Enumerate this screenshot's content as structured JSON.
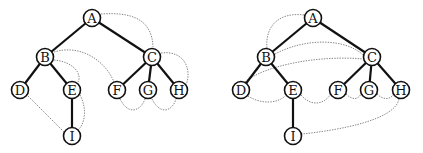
{
  "diagrams": [
    {
      "name": "left-tree",
      "nodes": [
        {
          "id": "A",
          "label": "A",
          "x": 92,
          "y": 18
        },
        {
          "id": "B",
          "label": "B",
          "x": 45,
          "y": 57
        },
        {
          "id": "C",
          "label": "C",
          "x": 152,
          "y": 57
        },
        {
          "id": "D",
          "label": "D",
          "x": 20,
          "y": 90
        },
        {
          "id": "E",
          "label": "E",
          "x": 72,
          "y": 90
        },
        {
          "id": "F",
          "label": "F",
          "x": 117,
          "y": 90
        },
        {
          "id": "G",
          "label": "G",
          "x": 148,
          "y": 90
        },
        {
          "id": "H",
          "label": "H",
          "x": 179,
          "y": 90
        },
        {
          "id": "I",
          "label": "I",
          "x": 72,
          "y": 136
        }
      ],
      "edges": [
        [
          "A",
          "B"
        ],
        [
          "A",
          "C"
        ],
        [
          "B",
          "D"
        ],
        [
          "B",
          "E"
        ],
        [
          "C",
          "F"
        ],
        [
          "C",
          "G"
        ],
        [
          "C",
          "H"
        ],
        [
          "E",
          "I"
        ]
      ],
      "threads": [
        [
          "A",
          "C"
        ],
        [
          "B",
          "F"
        ],
        [
          "B",
          "E"
        ],
        [
          "E",
          "I"
        ],
        [
          "D",
          "I"
        ],
        [
          "C",
          "H"
        ],
        [
          "F",
          "G"
        ],
        [
          "G",
          "H"
        ]
      ]
    },
    {
      "name": "right-tree",
      "nodes": [
        {
          "id": "A",
          "label": "A",
          "x": 313,
          "y": 18
        },
        {
          "id": "B",
          "label": "B",
          "x": 266,
          "y": 57
        },
        {
          "id": "C",
          "label": "C",
          "x": 372,
          "y": 57
        },
        {
          "id": "D",
          "label": "D",
          "x": 241,
          "y": 90
        },
        {
          "id": "E",
          "label": "E",
          "x": 293,
          "y": 90
        },
        {
          "id": "F",
          "label": "F",
          "x": 338,
          "y": 90
        },
        {
          "id": "G",
          "label": "G",
          "x": 369,
          "y": 90
        },
        {
          "id": "H",
          "label": "H",
          "x": 401,
          "y": 90
        },
        {
          "id": "I",
          "label": "I",
          "x": 293,
          "y": 136
        }
      ],
      "edges": [
        [
          "A",
          "B"
        ],
        [
          "A",
          "C"
        ],
        [
          "B",
          "D"
        ],
        [
          "B",
          "E"
        ],
        [
          "C",
          "F"
        ],
        [
          "C",
          "G"
        ],
        [
          "C",
          "H"
        ],
        [
          "E",
          "I"
        ]
      ],
      "threads": [
        [
          "A",
          "B"
        ],
        [
          "B",
          "C"
        ],
        [
          "D",
          "C"
        ],
        [
          "D",
          "E"
        ],
        [
          "E",
          "F"
        ],
        [
          "F",
          "G"
        ],
        [
          "G",
          "H"
        ],
        [
          "H",
          "I"
        ]
      ]
    }
  ]
}
